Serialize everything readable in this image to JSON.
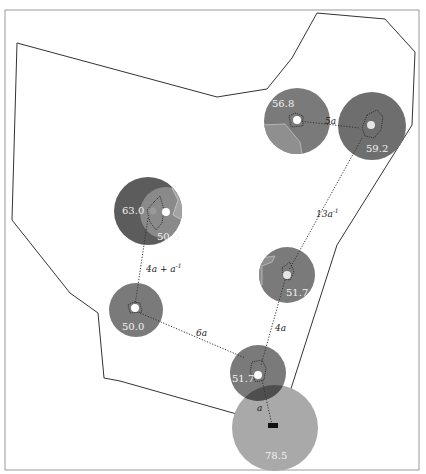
{
  "diagram": {
    "title": "",
    "frame": {
      "x": 5,
      "y": 10,
      "width": 414,
      "height": 460,
      "stroke": "#9a9a9a"
    },
    "region_polygon": {
      "stroke": "#333333",
      "points": [
        [
          17,
          43
        ],
        [
          217,
          97
        ],
        [
          267,
          89
        ],
        [
          292,
          58
        ],
        [
          317,
          13
        ],
        [
          385,
          19
        ],
        [
          415,
          52
        ],
        [
          412,
          125
        ],
        [
          337,
          245
        ],
        [
          279,
          426
        ],
        [
          120,
          381
        ],
        [
          104,
          378
        ],
        [
          98,
          313
        ],
        [
          70,
          293
        ],
        [
          12,
          220
        ]
      ]
    },
    "colors": {
      "node_dark": "#6e6e6e",
      "node_mid": "#8a8a8a",
      "node_light": "#a9a9a9",
      "node_overlap": "#4e4e4e",
      "center_dot": "#ffffff",
      "value_text": "#f2f2f2",
      "edge": "#333333"
    },
    "nodes": [
      {
        "id": "n1",
        "cx": 297,
        "cy": 121,
        "r": 33,
        "value": "56.8",
        "label_x": 272,
        "label_y": 107
      },
      {
        "id": "n2",
        "cx": 372,
        "cy": 126,
        "r": 34,
        "value": "59.2",
        "label_x": 368,
        "label_y": 152
      },
      {
        "id": "n3",
        "cx": 148,
        "cy": 211,
        "r": 34,
        "value": "63.0",
        "label_x": 124,
        "label_y": 210
      },
      {
        "id": "n4",
        "cx": 166,
        "cy": 213,
        "r": 26,
        "value": "50.6",
        "label_x": 157,
        "label_y": 240
      },
      {
        "id": "n5",
        "cx": 287,
        "cy": 275,
        "r": 28,
        "value": "51.7",
        "label_x": 287,
        "label_y": 295
      },
      {
        "id": "n6",
        "cx": 136,
        "cy": 310,
        "r": 27,
        "value": "50.0",
        "label_x": 122,
        "label_y": 330
      },
      {
        "id": "n7",
        "cx": 258,
        "cy": 373,
        "r": 28,
        "value": "51.7",
        "label_x": 233,
        "label_y": 380
      },
      {
        "id": "n8",
        "cx": 275,
        "cy": 428,
        "r": 43,
        "value": "78.5",
        "label_x": 266,
        "label_y": 458
      }
    ],
    "edges": [
      {
        "from": "n1",
        "to": "n2",
        "label": "5a",
        "sup": "",
        "label_x": 325,
        "label_y": 124
      },
      {
        "from": "n2",
        "to": "n5",
        "label": "13a",
        "sup": "-1",
        "label_x": 318,
        "label_y": 217
      },
      {
        "from": "n3",
        "to": "n6",
        "label": "4a + a",
        "sup": "-1",
        "label_x": 146,
        "label_y": 272
      },
      {
        "from": "n6",
        "to": "n7",
        "label": "6a",
        "sup": "",
        "label_x": 197,
        "label_y": 335
      },
      {
        "from": "n5",
        "to": "n7",
        "label": "4a",
        "sup": "",
        "label_x": 276,
        "label_y": 331
      },
      {
        "from": "n7",
        "to": "n8",
        "label": "a",
        "sup": "",
        "label_x": 257,
        "label_y": 410
      }
    ]
  }
}
